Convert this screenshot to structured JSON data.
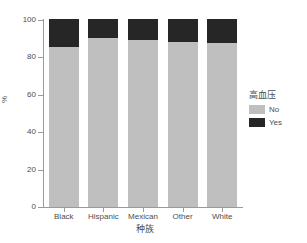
{
  "clipped_title": "",
  "chart_data": {
    "type": "bar",
    "subtype": "stacked-percent",
    "title": "",
    "xlabel": "种族",
    "ylabel": "%",
    "ylim": [
      0,
      100
    ],
    "yticks": [
      0,
      20,
      40,
      60,
      80,
      100
    ],
    "ytick_labels": [
      "0",
      "20",
      "40",
      "60",
      "80",
      "100"
    ],
    "categories": [
      "Black",
      "Hispanic",
      "Mexican",
      "Other",
      "White"
    ],
    "grid": false,
    "legend": {
      "title": "高血压",
      "position": "right",
      "entries": [
        {
          "label": "No",
          "color": "#bfbfbf"
        },
        {
          "label": "Yes",
          "color": "#262626"
        }
      ]
    },
    "series": [
      {
        "name": "No",
        "color": "#bfbfbf",
        "values": [
          85,
          90,
          89,
          88,
          87
        ]
      },
      {
        "name": "Yes",
        "color": "#262626",
        "values": [
          15,
          10,
          11,
          12,
          13
        ]
      }
    ]
  },
  "colors": {
    "background": "#ffffff",
    "axis": "#9a9a9a",
    "text": "#4d4d4d",
    "no": "#bfbfbf",
    "yes": "#262626"
  }
}
